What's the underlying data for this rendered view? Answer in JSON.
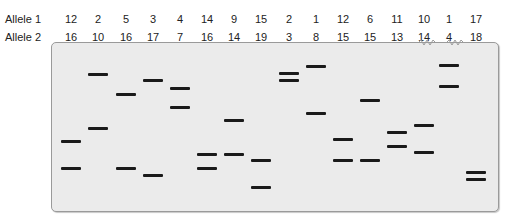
{
  "labels": {
    "allele1": "Allele 1",
    "allele2": "Allele 2"
  },
  "lanes": [
    {
      "x": 71,
      "a1": "12",
      "a2": "16",
      "bands": [
        141,
        168
      ]
    },
    {
      "x": 98,
      "a1": "2",
      "a2": "10",
      "bands": [
        74,
        128
      ]
    },
    {
      "x": 126,
      "a1": "5",
      "a2": "16",
      "bands": [
        94,
        168
      ]
    },
    {
      "x": 153,
      "a1": "3",
      "a2": "17",
      "bands": [
        80,
        175
      ]
    },
    {
      "x": 180,
      "a1": "4",
      "a2": "7",
      "bands": [
        88,
        107
      ]
    },
    {
      "x": 207,
      "a1": "14",
      "a2": "16",
      "bands": [
        154,
        168
      ]
    },
    {
      "x": 234,
      "a1": "9",
      "a2": "14",
      "bands": [
        120,
        154
      ]
    },
    {
      "x": 261,
      "a1": "15",
      "a2": "19",
      "bands": [
        160,
        187
      ]
    },
    {
      "x": 289,
      "a1": "2",
      "a2": "3",
      "bands": [
        73,
        80
      ]
    },
    {
      "x": 316,
      "a1": "1",
      "a2": "8",
      "bands": [
        66,
        113
      ]
    },
    {
      "x": 343,
      "a1": "12",
      "a2": "15",
      "bands": [
        139,
        160
      ]
    },
    {
      "x": 370,
      "a1": "6",
      "a2": "15",
      "bands": [
        100,
        160
      ]
    },
    {
      "x": 397,
      "a1": "11",
      "a2": "13",
      "bands": [
        132,
        146
      ]
    },
    {
      "x": 424,
      "a1": "10",
      "a2": "14",
      "bands": [
        125,
        152
      ]
    },
    {
      "x": 449,
      "a1": "1",
      "a2": "4",
      "bands": [
        65,
        86
      ]
    },
    {
      "x": 476,
      "a1": "17",
      "a2": "18",
      "bands": [
        172,
        179
      ]
    }
  ],
  "colors": {
    "band": "#1a1a1a",
    "gel": "#ebebeb",
    "border": "#9a9a9a"
  }
}
